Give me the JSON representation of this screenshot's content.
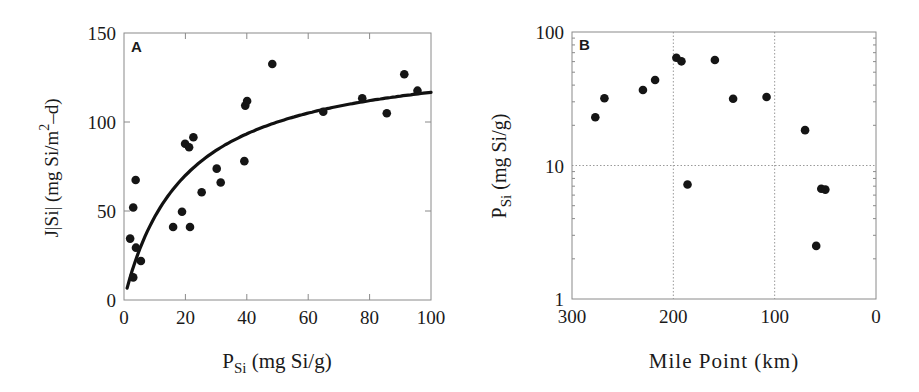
{
  "figure": {
    "panels": [
      "A",
      "B"
    ]
  },
  "chart_data": [
    {
      "type": "scatter",
      "panel_label": "A",
      "title": "",
      "xlabel": "P_Si (mg Si/g)",
      "xlabel_main": "P",
      "xlabel_sub": "Si",
      "xlabel_rest": " (mg Si/g)",
      "ylabel": "J[Si] (mg Si/m²–d)",
      "ylabel_main": "J|Si| (mg Si/m",
      "ylabel_sup": "2",
      "ylabel_rest": "–d)",
      "xlim": [
        0,
        100
      ],
      "ylim": [
        0,
        150
      ],
      "xticks": [
        0,
        20,
        40,
        60,
        80,
        100
      ],
      "yticks": [
        0,
        50,
        100,
        150
      ],
      "grid": false,
      "legend": null,
      "points": [
        {
          "x": 2.0,
          "y": 34.5
        },
        {
          "x": 3.0,
          "y": 52
        },
        {
          "x": 3.8,
          "y": 67.4
        },
        {
          "x": 3.9,
          "y": 29.4
        },
        {
          "x": 3.0,
          "y": 12.7
        },
        {
          "x": 5.5,
          "y": 21.9
        },
        {
          "x": 16.0,
          "y": 41
        },
        {
          "x": 18.9,
          "y": 49.6
        },
        {
          "x": 21.5,
          "y": 41
        },
        {
          "x": 19.9,
          "y": 87.8
        },
        {
          "x": 21.2,
          "y": 85.8
        },
        {
          "x": 22.6,
          "y": 91.4
        },
        {
          "x": 25.3,
          "y": 60.5
        },
        {
          "x": 30.2,
          "y": 73.8
        },
        {
          "x": 31.5,
          "y": 66
        },
        {
          "x": 39.2,
          "y": 78
        },
        {
          "x": 39.5,
          "y": 109.2
        },
        {
          "x": 40.1,
          "y": 111.8
        },
        {
          "x": 48.3,
          "y": 132.6
        },
        {
          "x": 64.9,
          "y": 105.8
        },
        {
          "x": 77.6,
          "y": 113.3
        },
        {
          "x": 85.6,
          "y": 104.9
        },
        {
          "x": 91.3,
          "y": 126.8
        },
        {
          "x": 95.6,
          "y": 117.6
        }
      ],
      "fit_curve": {
        "model": "J = Jmax*P/(K+P)",
        "Jmax": 140,
        "K": 20,
        "x_range": [
          1,
          100
        ]
      }
    },
    {
      "type": "scatter",
      "panel_label": "B",
      "title": "",
      "xlabel": "Mile Point (km)",
      "ylabel": "P_Si (mg Si/g)",
      "ylabel_main": "P",
      "ylabel_sub": "Si",
      "ylabel_rest": " (mg Si/g)",
      "xlim": [
        300,
        0
      ],
      "ylim": [
        1,
        100
      ],
      "yscale": "log",
      "xticks": [
        300,
        200,
        100,
        0
      ],
      "yticks": [
        1,
        10,
        100
      ],
      "grid": {
        "x": [
          200,
          100
        ],
        "y": [
          10
        ],
        "style": "dotted"
      },
      "legend": null,
      "points": [
        {
          "x": 277,
          "y": 23.0
        },
        {
          "x": 268,
          "y": 31.9
        },
        {
          "x": 230,
          "y": 36.8
        },
        {
          "x": 218,
          "y": 43.7
        },
        {
          "x": 197,
          "y": 64.2
        },
        {
          "x": 192,
          "y": 60.3
        },
        {
          "x": 186,
          "y": 7.2
        },
        {
          "x": 159,
          "y": 61.7
        },
        {
          "x": 141,
          "y": 31.6
        },
        {
          "x": 108,
          "y": 32.6
        },
        {
          "x": 70,
          "y": 18.4
        },
        {
          "x": 59,
          "y": 2.5
        },
        {
          "x": 54,
          "y": 6.7
        },
        {
          "x": 50,
          "y": 6.6
        }
      ]
    }
  ],
  "style": {
    "frame_color": "#8a8a8a",
    "marker_color": "#151515",
    "curve_color": "#111111",
    "grid_color": "#9a9a9a"
  }
}
